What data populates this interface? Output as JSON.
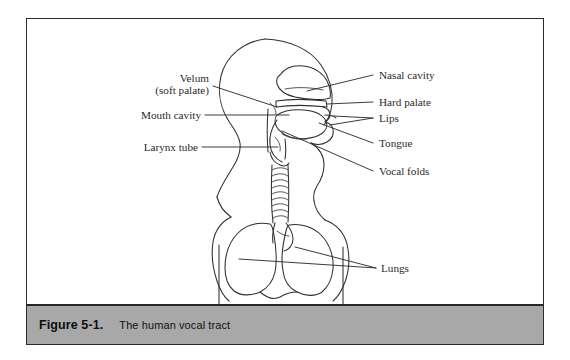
{
  "figure": {
    "caption_number": "Figure 5-1.",
    "caption_title": "The human vocal tract",
    "background_color": "#ffffff",
    "frame_color": "#2b2b2b",
    "caption_bar_color": "#a8a8a8",
    "ink_color": "#2f2f2f"
  },
  "labels": {
    "velum_line1": "Velum",
    "velum_line2": "(soft palate)",
    "mouth_cavity": "Mouth cavity",
    "larynx_tube": "Larynx tube",
    "nasal_cavity": "Nasal cavity",
    "hard_palate": "Hard palate",
    "lips": "Lips",
    "tongue": "Tongue",
    "vocal_folds": "Vocal folds",
    "lungs": "Lungs"
  },
  "diagram": {
    "subject": "human vocal tract",
    "view": "mid-sagittal side view of head, neck and thorax",
    "parts_labeled_left": [
      "Velum (soft palate)",
      "Mouth cavity",
      "Larynx tube"
    ],
    "parts_labeled_right": [
      "Nasal cavity",
      "Hard palate",
      "Lips",
      "Tongue",
      "Vocal folds",
      "Lungs"
    ]
  }
}
